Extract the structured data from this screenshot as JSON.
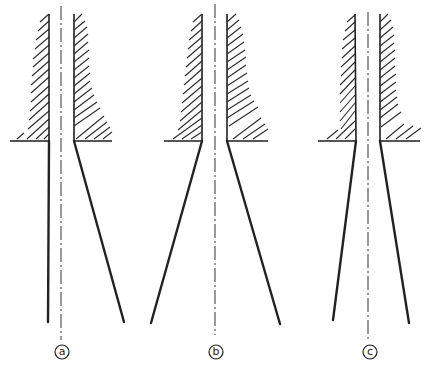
{
  "diagram": {
    "colors": {
      "ink": "#1e1e1e",
      "background": "#ffffff"
    },
    "panels": [
      {
        "id": "a",
        "label": "a",
        "axis_x": 61,
        "inner_left_x": 49,
        "inner_right_x": 74,
        "flange_y": 141,
        "flange_left_x": 10,
        "flange_right_x": 112,
        "jet_left": [
          [
            49,
            141
          ],
          [
            48,
            322
          ]
        ],
        "jet_right": [
          [
            74,
            141
          ],
          [
            124,
            322
          ]
        ],
        "label_pos": [
          62,
          352
        ]
      },
      {
        "id": "b",
        "label": "b",
        "axis_x": 215,
        "inner_left_x": 202,
        "inner_right_x": 227,
        "flange_y": 141,
        "flange_left_x": 164,
        "flange_right_x": 268,
        "jet_left": [
          [
            202,
            141
          ],
          [
            151,
            323
          ]
        ],
        "jet_right": [
          [
            227,
            141
          ],
          [
            280,
            324
          ]
        ],
        "label_pos": [
          216,
          352
        ]
      },
      {
        "id": "c",
        "label": "c",
        "axis_x": 368,
        "inner_left_x": 356,
        "inner_right_x": 380,
        "flange_y": 141,
        "flange_left_x": 318,
        "flange_right_x": 420,
        "jet_left": [
          [
            356,
            141
          ],
          [
            333,
            320
          ]
        ],
        "jet_right": [
          [
            380,
            141
          ],
          [
            409,
            323
          ]
        ],
        "label_pos": [
          370,
          352
        ]
      }
    ]
  }
}
